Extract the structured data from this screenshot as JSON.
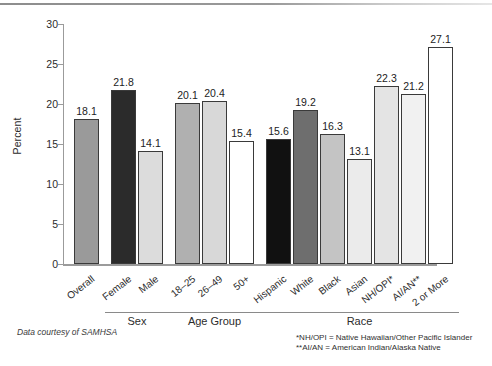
{
  "figure": {
    "source_note": "Data courtesy of SAMHSA",
    "footnotes": [
      "*NH/OPI = Native Hawaiian/Other Pacific Islander",
      "**AI/AN = American Indian/Alaska Native"
    ]
  },
  "chart_data": {
    "type": "bar",
    "title": "",
    "xlabel": "",
    "ylabel": "Percent",
    "ylim": [
      0,
      30
    ],
    "ytick_labels": [
      "0",
      "5",
      "10",
      "15",
      "20",
      "25",
      "30"
    ],
    "yticks": [
      0,
      5,
      10,
      15,
      20,
      25,
      30
    ],
    "grid": false,
    "legend": "none",
    "categories": [
      "Overall",
      "Female",
      "Male",
      "18–25",
      "26–49",
      "50+",
      "Hispanic",
      "White",
      "Black",
      "Asian",
      "NH/OPI*",
      "AI/AN**",
      "2 or More"
    ],
    "values": [
      18.1,
      21.8,
      14.1,
      20.1,
      20.4,
      15.4,
      15.6,
      19.2,
      16.3,
      13.1,
      22.3,
      21.2,
      27.1
    ],
    "value_labels": [
      "18.1",
      "21.8",
      "14.1",
      "20.1",
      "20.4",
      "15.4",
      "15.6",
      "19.2",
      "16.3",
      "13.1",
      "22.3",
      "21.2",
      "27.1"
    ],
    "bar_colors": [
      "#9a9a9a",
      "#2b2b2b",
      "#dcdcdc",
      "#b0b0b0",
      "#d8d8d8",
      "#ffffff",
      "#111111",
      "#6e6e6e",
      "#c4c4c4",
      "#ebebeb",
      "#e4e4e4",
      "#f1f1f1",
      "#ffffff"
    ],
    "bar_edge_color": "#3a3a3a",
    "groups": [
      {
        "label": "Sex",
        "members": [
          "Female",
          "Male"
        ]
      },
      {
        "label": "Age Group",
        "members": [
          "18–25",
          "26–49",
          "50+"
        ]
      },
      {
        "label": "Race",
        "members": [
          "Hispanic",
          "White",
          "Black",
          "Asian",
          "NH/OPI*",
          "AI/AN**",
          "2 or More"
        ]
      }
    ]
  }
}
